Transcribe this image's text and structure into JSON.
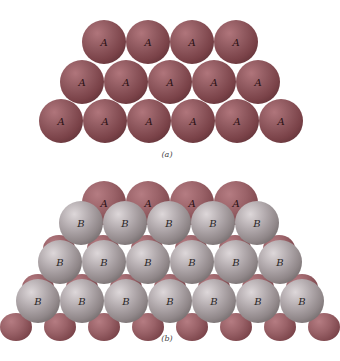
{
  "figure": {
    "sphere_radius": 22,
    "spacing": 44,
    "colors": {
      "layer_a": "#8a4f55",
      "layer_b": "#a09a9c",
      "background": "#ffffff"
    }
  },
  "panel_a": {
    "caption": "(a)",
    "description": "Close-packed layer A with B sites visible in gaps",
    "rows": [
      {
        "y": 42,
        "x_start": 104,
        "count": 4,
        "label": "A"
      },
      {
        "y": 82,
        "x_start": 82,
        "count": 5,
        "label": "A"
      },
      {
        "y": 121,
        "x_start": 61,
        "count": 6,
        "label": "A"
      }
    ],
    "gap_label": "B"
  },
  "panel_b": {
    "caption": "(b)",
    "description": "Layer B stacked on top of layer A",
    "rows": [
      {
        "y": 23,
        "x_start": 104,
        "count": 4,
        "label": "A",
        "layer": "a"
      },
      {
        "y": 43,
        "x_start": 81,
        "count": 5,
        "label": "B",
        "layer": "b"
      },
      {
        "y": 82,
        "x_start": 60,
        "count": 6,
        "label": "B",
        "layer": "b"
      },
      {
        "y": 121,
        "x_start": 38,
        "count": 7,
        "label": "B",
        "layer": "b"
      }
    ]
  }
}
